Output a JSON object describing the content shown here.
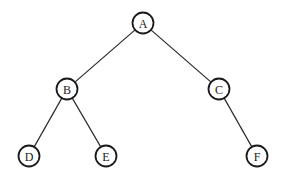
{
  "diagram": {
    "type": "binary-tree",
    "node_radius": 10.5,
    "nodes": [
      {
        "id": "A",
        "label": "A",
        "x": 143,
        "y": 23
      },
      {
        "id": "B",
        "label": "B",
        "x": 67,
        "y": 89
      },
      {
        "id": "C",
        "label": "C",
        "x": 219,
        "y": 89
      },
      {
        "id": "D",
        "label": "D",
        "x": 29,
        "y": 156
      },
      {
        "id": "E",
        "label": "E",
        "x": 106,
        "y": 156
      },
      {
        "id": "F",
        "label": "F",
        "x": 257,
        "y": 156
      }
    ],
    "edges": [
      {
        "from": "A",
        "to": "B"
      },
      {
        "from": "A",
        "to": "C"
      },
      {
        "from": "B",
        "to": "D"
      },
      {
        "from": "B",
        "to": "E"
      },
      {
        "from": "C",
        "to": "F"
      }
    ]
  }
}
